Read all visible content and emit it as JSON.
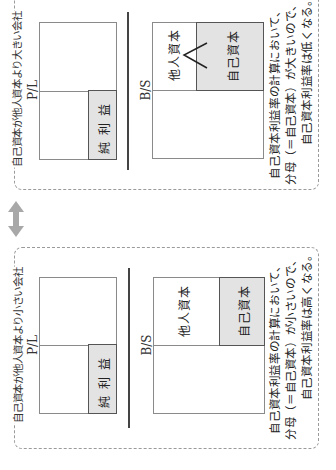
{
  "orientation": "rotated-90-ccw",
  "arrow": {
    "icon": "double-arrow-icon",
    "color": "#a8a8a8"
  },
  "panels": [
    {
      "title": "自己資本が他人資本より大きい会社",
      "pl": {
        "label": "P/L",
        "net_income": "純利益"
      },
      "bs": {
        "label": "B/S",
        "liabilities": "他人資本",
        "equity": "自己資本"
      },
      "note_lines": [
        "自己資本利益率の計算において、",
        "分母（＝自己資本）が大きいので、",
        "自己資本利益率は低くなる。"
      ]
    },
    {
      "title": "自己資本が他人資本より小さい会社",
      "pl": {
        "label": "P/L",
        "net_income": "純利益"
      },
      "bs": {
        "label": "B/S",
        "liabilities": "他人資本",
        "equity": "自己資本"
      },
      "note_lines": [
        "自己資本利益率の計算において、",
        "分母（＝自己資本）が小さいので、",
        "自己資本利益率は高くなる。"
      ]
    }
  ],
  "colors": {
    "gray_fill": "#e3e3e3",
    "border": "#8a8a8a",
    "dashed": "#9a9a9a"
  }
}
